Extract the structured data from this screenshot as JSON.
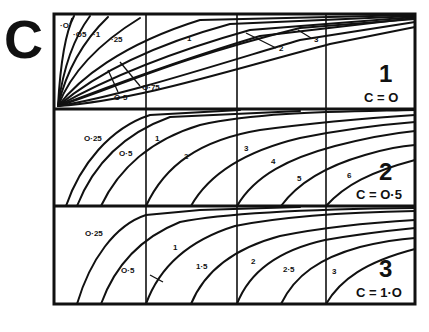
{
  "figure": {
    "letter": "C",
    "frame": {
      "x": 54,
      "y": 14,
      "w": 361,
      "h": 290
    },
    "vertical_lines_x": [
      146,
      237,
      326
    ],
    "panel_dividers_y": [
      109,
      206
    ],
    "colors": {
      "ink": "#111111",
      "paper": "#ffffff"
    }
  },
  "panels": [
    {
      "id": 1,
      "number": "1",
      "equation": "C = O",
      "c_value": 0,
      "curve_labels": [
        "·O",
        "·O5",
        "·1",
        "·25",
        "O·5",
        "O·75",
        "1",
        "2",
        "3"
      ],
      "labels": [
        {
          "text": "·O",
          "x": 60,
          "y": 28
        },
        {
          "text": "·O5",
          "x": 73,
          "y": 37
        },
        {
          "text": "·1",
          "x": 93,
          "y": 37
        },
        {
          "text": "·25",
          "x": 111,
          "y": 42
        },
        {
          "text": "O·5",
          "x": 114,
          "y": 100
        },
        {
          "text": "O·75",
          "x": 142,
          "y": 90
        },
        {
          "text": "1",
          "x": 187,
          "y": 41
        },
        {
          "text": "2",
          "x": 279,
          "y": 51
        },
        {
          "text": "3",
          "x": 314,
          "y": 42
        }
      ]
    },
    {
      "id": 2,
      "number": "2",
      "equation": "C = O·5",
      "c_value": 0.5,
      "curve_labels": [
        "O·25",
        "O·5",
        "1",
        "2",
        "3",
        "4",
        "5",
        "6"
      ],
      "labels": [
        {
          "text": "O·25",
          "x": 85,
          "y": 141
        },
        {
          "text": "O·5",
          "x": 120,
          "y": 156
        },
        {
          "text": "1",
          "x": 155,
          "y": 141
        },
        {
          "text": "2",
          "x": 184,
          "y": 159
        },
        {
          "text": "3",
          "x": 244,
          "y": 151
        },
        {
          "text": "4",
          "x": 271,
          "y": 164
        },
        {
          "text": "5",
          "x": 297,
          "y": 181
        },
        {
          "text": "6",
          "x": 347,
          "y": 178
        }
      ]
    },
    {
      "id": 3,
      "number": "3",
      "equation": "C = 1·O",
      "c_value": 1.0,
      "curve_labels": [
        "O·25",
        "O·5",
        "1",
        "1·5",
        "2",
        "2·5",
        "3"
      ],
      "labels": [
        {
          "text": "O·25",
          "x": 86,
          "y": 236
        },
        {
          "text": "O·5",
          "x": 122,
          "y": 273
        },
        {
          "text": "1",
          "x": 173,
          "y": 250
        },
        {
          "text": "1·5",
          "x": 197,
          "y": 269
        },
        {
          "text": "2",
          "x": 251,
          "y": 264
        },
        {
          "text": "2·5",
          "x": 283,
          "y": 272
        },
        {
          "text": "3",
          "x": 332,
          "y": 274
        }
      ]
    }
  ]
}
